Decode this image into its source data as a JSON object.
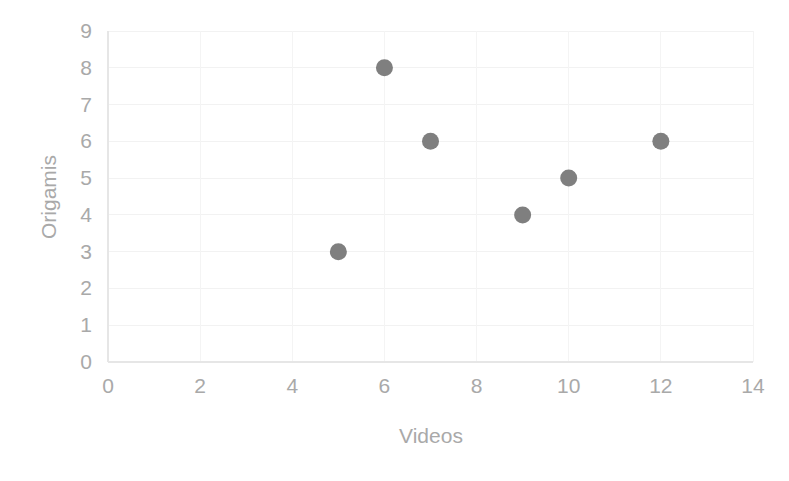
{
  "chart_data": {
    "type": "scatter",
    "title": "",
    "xlabel": "Videos",
    "ylabel": "Origamis",
    "xlim": [
      0,
      14
    ],
    "ylim": [
      0,
      9
    ],
    "xticks": [
      0,
      2,
      4,
      6,
      8,
      10,
      12,
      14
    ],
    "yticks": [
      0,
      1,
      2,
      3,
      4,
      5,
      6,
      7,
      8,
      9
    ],
    "xtick_labels": [
      "0",
      "2",
      "4",
      "6",
      "8",
      "10",
      "12",
      "14"
    ],
    "ytick_labels": [
      "0",
      "1",
      "2",
      "3",
      "4",
      "5",
      "6",
      "7",
      "8",
      "9"
    ],
    "grid": true,
    "legend": false,
    "marker_color": "#7f7f7f",
    "gridline_color": "#f2f2f2",
    "text_color": "#a9a9a9",
    "points": [
      {
        "x": 5,
        "y": 3
      },
      {
        "x": 6,
        "y": 8
      },
      {
        "x": 7,
        "y": 6
      },
      {
        "x": 9,
        "y": 4
      },
      {
        "x": 10,
        "y": 5
      },
      {
        "x": 12,
        "y": 6
      }
    ],
    "series": [
      {
        "name": "",
        "x": [
          5,
          6,
          7,
          9,
          10,
          12
        ],
        "values": [
          3,
          8,
          6,
          4,
          5,
          6
        ]
      }
    ]
  }
}
